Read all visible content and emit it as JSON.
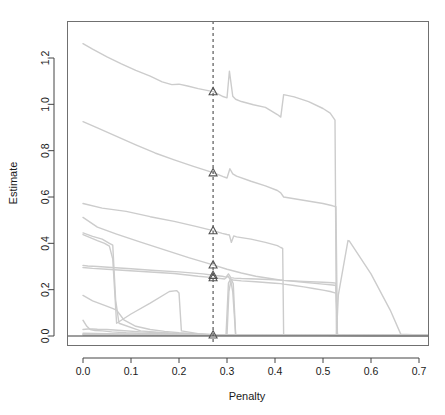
{
  "chart_data": {
    "type": "line",
    "title": "",
    "xlabel": "Penalty",
    "ylabel": "Estimate",
    "xlim": [
      -0.02,
      0.735
    ],
    "ylim": [
      -0.035,
      1.35
    ],
    "xticks": [
      0.0,
      0.1,
      0.2,
      0.3,
      0.4,
      0.5,
      0.6,
      0.7
    ],
    "xticklabels": [
      "0.0",
      "0.1",
      "0.2",
      "0.3",
      "0.4",
      "0.5",
      "0.6",
      "0.7"
    ],
    "yticks": [
      0.0,
      0.2,
      0.4,
      0.6,
      0.8,
      1.0,
      1.2
    ],
    "yticklabels": [
      "0.0",
      "0.2",
      "0.4",
      "0.6",
      "0.8",
      "1.0",
      "1.2"
    ],
    "grid": false,
    "legend": "none",
    "line_color": "#cccccc",
    "marker_color": "#555555",
    "vline_color": "#4a4a4a",
    "zero_line_color": "#3d3d3d",
    "annotations": {
      "vertical_reference_line": {
        "x": 0.271,
        "style": "dashed",
        "label": ""
      },
      "selected_estimates_at_vline": [
        1.055,
        0.705,
        0.455,
        0.307,
        0.262,
        0.252,
        0.005
      ]
    },
    "series": [
      {
        "name": "path-1",
        "x": [
          0.0,
          0.02,
          0.05,
          0.08,
          0.11,
          0.14,
          0.165,
          0.185,
          0.2,
          0.218,
          0.24,
          0.271,
          0.29,
          0.3,
          0.305,
          0.312,
          0.318,
          0.33,
          0.355,
          0.38,
          0.405,
          0.412,
          0.418,
          0.44,
          0.47,
          0.5,
          0.515,
          0.525,
          0.528,
          0.53,
          0.66,
          0.73
        ],
        "values": [
          1.262,
          1.238,
          1.205,
          1.175,
          1.147,
          1.122,
          1.097,
          1.085,
          1.087,
          1.079,
          1.068,
          1.055,
          1.035,
          1.028,
          1.143,
          1.035,
          1.022,
          1.012,
          0.998,
          0.987,
          0.956,
          0.945,
          1.042,
          1.032,
          1.012,
          0.982,
          0.962,
          0.932,
          0.01,
          0.006,
          0.004,
          0.004
        ]
      },
      {
        "name": "path-2",
        "x": [
          0.0,
          0.03,
          0.07,
          0.11,
          0.15,
          0.19,
          0.23,
          0.271,
          0.292,
          0.3,
          0.306,
          0.312,
          0.32,
          0.35,
          0.38,
          0.405,
          0.412,
          0.418,
          0.5,
          0.52,
          0.527,
          0.53,
          0.66,
          0.73
        ],
        "values": [
          0.925,
          0.898,
          0.862,
          0.825,
          0.79,
          0.76,
          0.732,
          0.705,
          0.688,
          0.682,
          0.722,
          0.7,
          0.69,
          0.668,
          0.648,
          0.628,
          0.618,
          0.6,
          0.572,
          0.562,
          0.558,
          0.006,
          0.004,
          0.004
        ]
      },
      {
        "name": "path-3",
        "x": [
          0.0,
          0.04,
          0.09,
          0.14,
          0.19,
          0.235,
          0.271,
          0.29,
          0.3,
          0.305,
          0.309,
          0.314,
          0.32,
          0.35,
          0.38,
          0.405,
          0.412,
          0.416,
          0.418,
          0.66,
          0.73
        ],
        "values": [
          0.572,
          0.552,
          0.538,
          0.515,
          0.495,
          0.473,
          0.455,
          0.443,
          0.438,
          0.436,
          0.404,
          0.432,
          0.428,
          0.418,
          0.404,
          0.39,
          0.382,
          0.378,
          0.005,
          0.003,
          0.003
        ]
      },
      {
        "name": "path-4",
        "x": [
          0.0,
          0.03,
          0.07,
          0.12,
          0.17,
          0.22,
          0.271,
          0.3,
          0.33,
          0.36,
          0.39,
          0.41,
          0.418,
          0.46,
          0.5,
          0.52,
          0.527,
          0.53,
          0.66,
          0.73
        ],
        "values": [
          0.512,
          0.47,
          0.44,
          0.405,
          0.372,
          0.338,
          0.307,
          0.288,
          0.272,
          0.258,
          0.248,
          0.242,
          0.24,
          0.232,
          0.224,
          0.22,
          0.218,
          0.005,
          0.003,
          0.003
        ]
      },
      {
        "name": "path-5",
        "x": [
          0.0,
          0.01,
          0.03,
          0.06,
          0.1,
          0.15,
          0.2,
          0.25,
          0.271,
          0.29,
          0.298,
          0.303,
          0.308,
          0.315,
          0.33,
          0.36,
          0.4,
          0.412,
          0.418,
          0.46,
          0.5,
          0.52,
          0.527,
          0.53,
          0.66,
          0.73
        ],
        "values": [
          0.305,
          0.302,
          0.3,
          0.296,
          0.29,
          0.283,
          0.277,
          0.268,
          0.262,
          0.258,
          0.254,
          0.268,
          0.252,
          0.25,
          0.248,
          0.246,
          0.243,
          0.241,
          0.24,
          0.236,
          0.232,
          0.23,
          0.228,
          0.004,
          0.003,
          0.003
        ]
      },
      {
        "name": "path-6",
        "x": [
          0.0,
          0.02,
          0.05,
          0.09,
          0.14,
          0.19,
          0.24,
          0.271,
          0.295,
          0.302,
          0.307,
          0.313,
          0.33,
          0.36,
          0.4,
          0.412,
          0.418,
          0.44,
          0.46,
          0.48,
          0.5,
          0.515,
          0.525,
          0.528,
          0.53,
          0.66,
          0.73
        ],
        "values": [
          0.296,
          0.292,
          0.288,
          0.283,
          0.276,
          0.27,
          0.258,
          0.252,
          0.246,
          0.258,
          0.244,
          0.242,
          0.238,
          0.234,
          0.228,
          0.226,
          0.224,
          0.218,
          0.212,
          0.205,
          0.198,
          0.192,
          0.186,
          0.184,
          0.004,
          0.003,
          0.003
        ]
      },
      {
        "name": "path-7",
        "x": [
          0.0,
          0.02,
          0.04,
          0.055,
          0.062,
          0.068,
          0.075,
          0.12,
          0.18,
          0.22,
          0.26,
          0.271,
          0.3,
          0.35,
          0.4,
          0.412,
          0.418,
          0.66,
          0.73
        ],
        "values": [
          0.445,
          0.43,
          0.418,
          0.4,
          0.392,
          0.155,
          0.055,
          0.022,
          0.012,
          0.008,
          0.006,
          0.005,
          0.005,
          0.004,
          0.004,
          0.004,
          0.003,
          0.003,
          0.003
        ]
      },
      {
        "name": "path-8",
        "x": [
          0.0,
          0.015,
          0.03,
          0.045,
          0.055,
          0.062,
          0.07,
          0.1,
          0.14,
          0.18,
          0.195,
          0.2,
          0.205,
          0.24,
          0.271,
          0.3,
          0.35,
          0.4,
          0.66,
          0.73
        ],
        "values": [
          0.438,
          0.425,
          0.412,
          0.4,
          0.388,
          0.332,
          0.055,
          0.095,
          0.142,
          0.192,
          0.196,
          0.186,
          0.022,
          0.01,
          0.006,
          0.005,
          0.004,
          0.004,
          0.003,
          0.003
        ]
      },
      {
        "name": "path-9",
        "x": [
          0.0,
          0.02,
          0.045,
          0.06,
          0.07,
          0.085,
          0.11,
          0.14,
          0.17,
          0.2,
          0.24,
          0.271,
          0.3,
          0.35,
          0.4,
          0.66,
          0.73
        ],
        "values": [
          0.175,
          0.152,
          0.132,
          0.12,
          0.112,
          0.07,
          0.042,
          0.028,
          0.02,
          0.014,
          0.009,
          0.006,
          0.005,
          0.004,
          0.004,
          0.003,
          0.003
        ]
      },
      {
        "name": "path-10",
        "x": [
          0.0,
          0.008,
          0.015,
          0.025,
          0.04,
          0.06,
          0.09,
          0.13,
          0.18,
          0.23,
          0.271,
          0.3,
          0.35,
          0.4,
          0.45,
          0.5,
          0.55,
          0.6,
          0.65,
          0.66,
          0.73
        ],
        "values": [
          0.068,
          0.042,
          0.028,
          0.024,
          0.022,
          0.018,
          0.014,
          0.011,
          0.009,
          0.007,
          0.005,
          0.005,
          0.004,
          0.004,
          0.004,
          0.003,
          0.003,
          0.003,
          0.003,
          0.002,
          0.002
        ]
      },
      {
        "name": "path-11",
        "x": [
          0.0,
          0.01,
          0.02,
          0.03,
          0.05,
          0.08,
          0.12,
          0.17,
          0.22,
          0.271,
          0.3,
          0.35,
          0.4,
          0.5,
          0.6,
          0.66,
          0.73
        ],
        "values": [
          0.028,
          0.03,
          0.03,
          0.029,
          0.028,
          0.024,
          0.018,
          0.013,
          0.009,
          0.005,
          0.004,
          0.004,
          0.003,
          0.003,
          0.002,
          0.002,
          0.002
        ]
      },
      {
        "name": "path-12-spike-a",
        "x": [
          0.0,
          0.05,
          0.12,
          0.2,
          0.25,
          0.271,
          0.29,
          0.298,
          0.303,
          0.308,
          0.313,
          0.318,
          0.33,
          0.4,
          0.5,
          0.6,
          0.66,
          0.73
        ],
        "values": [
          0.012,
          0.01,
          0.008,
          0.006,
          0.005,
          0.004,
          0.004,
          0.006,
          0.228,
          0.248,
          0.226,
          0.006,
          0.004,
          0.004,
          0.003,
          0.002,
          0.002,
          0.002
        ]
      },
      {
        "name": "path-13-spike-b",
        "x": [
          0.0,
          0.1,
          0.2,
          0.271,
          0.3,
          0.304,
          0.308,
          0.312,
          0.318,
          0.4,
          0.5,
          0.6,
          0.66,
          0.73
        ],
        "values": [
          0.008,
          0.006,
          0.005,
          0.004,
          0.004,
          0.192,
          0.238,
          0.19,
          0.005,
          0.004,
          0.003,
          0.002,
          0.002,
          0.002
        ]
      },
      {
        "name": "path-14-late-triangle",
        "x": [
          0.0,
          0.1,
          0.2,
          0.271,
          0.35,
          0.45,
          0.5,
          0.52,
          0.528,
          0.532,
          0.552,
          0.555,
          0.6,
          0.64,
          0.662,
          0.7,
          0.73
        ],
        "values": [
          0.006,
          0.005,
          0.004,
          0.004,
          0.004,
          0.003,
          0.003,
          0.003,
          0.004,
          0.178,
          0.412,
          0.41,
          0.268,
          0.112,
          0.008,
          0.004,
          0.004
        ]
      },
      {
        "name": "path-15-baseline",
        "x": [
          0.0,
          0.1,
          0.2,
          0.271,
          0.35,
          0.45,
          0.55,
          0.65,
          0.73
        ],
        "values": [
          0.004,
          0.004,
          0.003,
          0.003,
          0.003,
          0.003,
          0.003,
          0.003,
          0.003
        ]
      }
    ]
  },
  "plot": {
    "box": {
      "left": 67,
      "top": 21,
      "right": 428,
      "bottom": 345
    },
    "marker_shape": "triangle-up"
  }
}
